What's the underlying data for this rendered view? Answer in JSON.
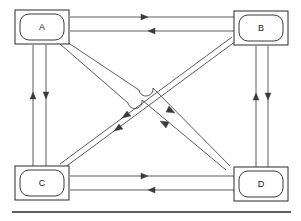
{
  "figure": {
    "background_color": "#ffffff",
    "line_color": "#4a4a4a",
    "node_stroke_color": "#2b2b2b",
    "label_color": "#1a1a1a"
  },
  "nodes": [
    {
      "id": "A",
      "label": "A",
      "cx": 42,
      "cy": 27,
      "w": 54,
      "h": 34
    },
    {
      "id": "B",
      "label": "B",
      "cx": 261,
      "cy": 28,
      "w": 54,
      "h": 34
    },
    {
      "id": "C",
      "label": "C",
      "cx": 42,
      "cy": 183,
      "w": 54,
      "h": 34
    },
    {
      "id": "D",
      "label": "D",
      "cx": 261,
      "cy": 184,
      "w": 54,
      "h": 34
    }
  ],
  "links": [
    {
      "name": "a-b-top",
      "from": "A",
      "to": "B",
      "direction": "right",
      "kind": "horizontal"
    },
    {
      "name": "b-a-top",
      "from": "B",
      "to": "A",
      "direction": "left",
      "kind": "horizontal"
    },
    {
      "name": "c-d-bottom",
      "from": "C",
      "to": "D",
      "direction": "right",
      "kind": "horizontal"
    },
    {
      "name": "d-c-bottom",
      "from": "D",
      "to": "C",
      "direction": "left",
      "kind": "horizontal"
    },
    {
      "name": "c-a-left",
      "from": "C",
      "to": "A",
      "direction": "up",
      "kind": "vertical"
    },
    {
      "name": "a-c-left",
      "from": "A",
      "to": "C",
      "direction": "down",
      "kind": "vertical"
    },
    {
      "name": "d-b-right",
      "from": "D",
      "to": "B",
      "direction": "up",
      "kind": "vertical"
    },
    {
      "name": "b-d-right",
      "from": "B",
      "to": "D",
      "direction": "down",
      "kind": "vertical"
    },
    {
      "name": "a-d-diagonal",
      "from": "A",
      "to": "D",
      "direction": "down-right",
      "kind": "diagonal"
    },
    {
      "name": "d-a-diagonal",
      "from": "D",
      "to": "A",
      "direction": "up-left",
      "kind": "diagonal"
    },
    {
      "name": "b-c-diagonal",
      "from": "B",
      "to": "C",
      "direction": "down-left",
      "kind": "diagonal"
    },
    {
      "name": "c-b-diagonal",
      "from": "C",
      "to": "B",
      "direction": "up-right",
      "kind": "diagonal"
    }
  ],
  "crossings": [
    {
      "name": "diagonal-hop-upper",
      "cx": 151,
      "cy": 88,
      "over": "a-d-diagonal"
    },
    {
      "name": "diagonal-hop-lower",
      "cx": 137,
      "cy": 100,
      "over": "a-d-diagonal"
    }
  ],
  "baseline": {
    "name": "bottom-rule",
    "x1": 12,
    "x2": 291,
    "y": 212
  }
}
